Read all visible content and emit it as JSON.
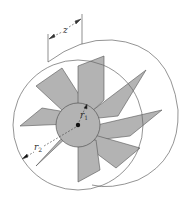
{
  "diagram": {
    "type": "radial-vane-rotor-in-cylinder",
    "labels": {
      "length": "z",
      "inner_radius_base": "r",
      "inner_radius_sub": "1",
      "outer_radius_base": "r",
      "outer_radius_sub": "2"
    },
    "colors": {
      "vane_fill": "#b3b3b3",
      "stroke": "#555555",
      "background": "#ffffff"
    },
    "vane_count": 8
  }
}
